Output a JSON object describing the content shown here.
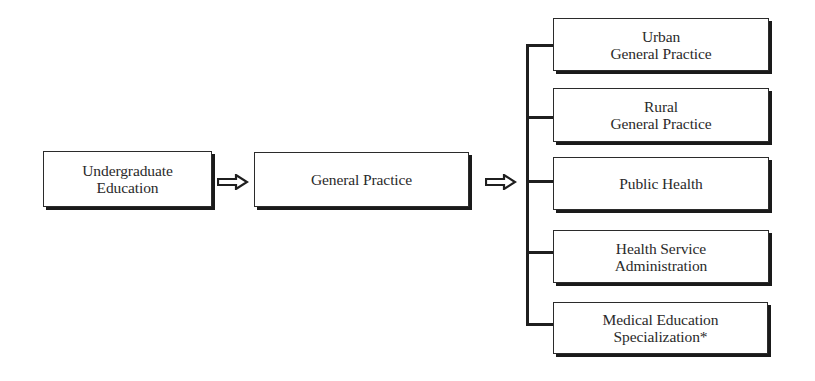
{
  "diagram": {
    "type": "flowchart",
    "nodes": {
      "undergraduate": {
        "label": "Undergraduate\nEducation"
      },
      "general_practice": {
        "label": "General Practice"
      },
      "branches": [
        {
          "id": "urban",
          "label": "Urban\nGeneral Practice"
        },
        {
          "id": "rural",
          "label": "Rural\nGeneral Practice"
        },
        {
          "id": "public_health",
          "label": "Public Health"
        },
        {
          "id": "health_service_admin",
          "label": "Health Service\nAdministration"
        },
        {
          "id": "medical_education",
          "label": "Medical Education\nSpecialization*"
        }
      ]
    },
    "edges": [
      {
        "from": "undergraduate",
        "to": "general_practice",
        "style": "hollow-arrow"
      },
      {
        "from": "general_practice",
        "to": "branches",
        "style": "hollow-arrow-to-bracket"
      }
    ],
    "icons": {
      "arrow_1": "hollow-right-arrow-icon",
      "arrow_2": "hollow-right-arrow-icon"
    }
  }
}
